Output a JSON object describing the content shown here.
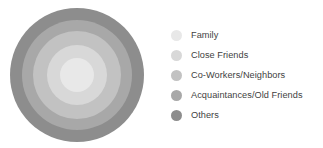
{
  "figure": {
    "type": "concentric-circles",
    "title": "",
    "rings": [
      {
        "id": "family",
        "label": "Family",
        "color": "#e8e8e8",
        "diameter_px": 34,
        "order_from_center": 1
      },
      {
        "id": "close-friends",
        "label": "Close Friends",
        "color": "#d8d8d8",
        "diameter_px": 60,
        "order_from_center": 2
      },
      {
        "id": "coworkers",
        "label": "Co-Workers/Neighbors",
        "color": "#c2c2c2",
        "diameter_px": 88,
        "order_from_center": 3
      },
      {
        "id": "acquaintances",
        "label": "Acquaintances/Old Friends",
        "color": "#a8a8a8",
        "diameter_px": 110,
        "order_from_center": 4
      },
      {
        "id": "others",
        "label": "Others",
        "color": "#8d8d8d",
        "diameter_px": 134,
        "order_from_center": 5
      }
    ]
  },
  "legend": {
    "position": "right",
    "items": [
      {
        "label": "Family",
        "color": "#e8e8e8",
        "swatch_icon": "circle-swatch-icon"
      },
      {
        "label": "Close Friends",
        "color": "#d8d8d8",
        "swatch_icon": "circle-swatch-icon"
      },
      {
        "label": "Co-Workers/Neighbors",
        "color": "#c2c2c2",
        "swatch_icon": "circle-swatch-icon"
      },
      {
        "label": "Acquaintances/Old Friends",
        "color": "#a8a8a8",
        "swatch_icon": "circle-swatch-icon"
      },
      {
        "label": "Others",
        "color": "#8d8d8d",
        "swatch_icon": "circle-swatch-icon"
      }
    ]
  },
  "colors": {
    "background": "#ffffff",
    "text": "#3f3f3f"
  }
}
